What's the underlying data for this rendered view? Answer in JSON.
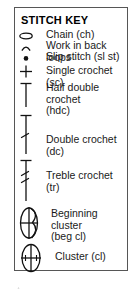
{
  "panel": {
    "title": "STITCH KEY",
    "border_color": "#565656",
    "background_color": "#ffffff",
    "text_color": "#1a1a1a"
  },
  "legend": {
    "rows": [
      {
        "symbol": "oval-chain-icon",
        "label": "Chain (ch)"
      },
      {
        "symbol": "arc-back-loop-icon",
        "label": "Work in back loops"
      },
      {
        "symbol": "dot-slip-stitch-icon",
        "label": "Slip stitch (sl st)"
      },
      {
        "symbol": "plus-single-crochet-icon",
        "label": "Single crochet (sc)"
      },
      {
        "symbol": "tee-half-double-crochet-icon",
        "label": "Half double crochet\n(hdc)"
      },
      {
        "symbol": "double-crochet-icon",
        "label": "Double crochet (dc)"
      },
      {
        "symbol": "treble-crochet-icon",
        "label": "Treble crochet (tr)"
      },
      {
        "symbol": "beginning-cluster-icon",
        "label": "Beginning cluster\n(beg cl)"
      },
      {
        "symbol": "cluster-icon",
        "label": "Cluster (cl)"
      }
    ]
  }
}
